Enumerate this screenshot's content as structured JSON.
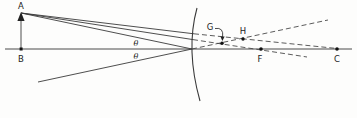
{
  "figure": {
    "labels": {
      "object_tip": "A",
      "object_base": "B",
      "point_g": "G",
      "point_h": "H",
      "focal_point": "F",
      "center_of_curvature": "C",
      "angle_incidence": "θ",
      "angle_reflection": "θ"
    }
  }
}
